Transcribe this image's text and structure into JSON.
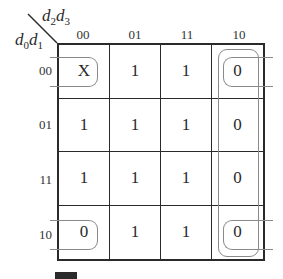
{
  "kmap": {
    "col_var_label": "d2d3",
    "row_var_label": "d0d1",
    "col_var": {
      "a": "d",
      "a_sub": "2",
      "b": "d",
      "b_sub": "3"
    },
    "row_var": {
      "a": "d",
      "a_sub": "0",
      "b": "d",
      "b_sub": "1"
    },
    "col_headers": [
      "00",
      "01",
      "11",
      "10"
    ],
    "row_headers": [
      "00",
      "01",
      "11",
      "10"
    ],
    "cells": [
      [
        "X",
        "1",
        "1",
        "0"
      ],
      [
        "1",
        "1",
        "1",
        "0"
      ],
      [
        "1",
        "1",
        "1",
        "0"
      ],
      [
        "0",
        "1",
        "1",
        "0"
      ]
    ],
    "groupings": [
      {
        "name": "corners-group",
        "cells": [
          [
            0,
            0
          ],
          [
            0,
            3
          ],
          [
            3,
            0
          ],
          [
            3,
            3
          ]
        ],
        "wraps": true
      },
      {
        "name": "column-10-group",
        "cells": [
          [
            0,
            3
          ],
          [
            1,
            3
          ],
          [
            2,
            3
          ],
          [
            3,
            3
          ]
        ]
      }
    ],
    "colors": {
      "line": "#2a2a2a",
      "loop": "#8a8a8a",
      "text": "#2a2a2a"
    }
  }
}
